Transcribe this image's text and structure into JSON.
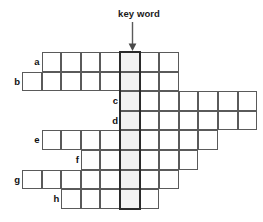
{
  "annotation": {
    "keyword_label": "key word",
    "arrow_icon": "down-arrow-icon",
    "arrow_target_column": 5
  },
  "grid": {
    "cell_size": 19.6,
    "origin_x": 22,
    "origin_y": 52,
    "key_column_index": 5,
    "key_column_fill": "#f2f2f2",
    "cell_border_color": "#5a5a5a",
    "key_outline_color": "#2a2a2a",
    "rows": [
      {
        "label": "a",
        "start_col": 1,
        "length": 7
      },
      {
        "label": "b",
        "start_col": 0,
        "length": 8
      },
      {
        "label": "c",
        "start_col": 5,
        "length": 7
      },
      {
        "label": "d",
        "start_col": 5,
        "length": 7
      },
      {
        "label": "e",
        "start_col": 1,
        "length": 9
      },
      {
        "label": "f",
        "start_col": 3,
        "length": 6
      },
      {
        "label": "g",
        "start_col": 0,
        "length": 8
      },
      {
        "label": "h",
        "start_col": 2,
        "length": 5
      }
    ]
  }
}
